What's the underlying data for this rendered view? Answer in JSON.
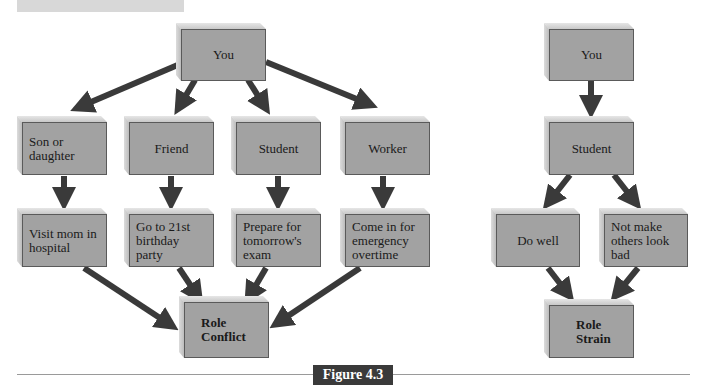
{
  "figure": {
    "label": "Figure 4.3"
  },
  "role_conflict": {
    "root": "You",
    "roles": [
      "Son or\ndaughter",
      "Friend",
      "Student",
      "Worker"
    ],
    "demands": [
      "Visit mom in\nhospital",
      "Go to 21st\nbirthday\nparty",
      "Prepare for\ntomorrow's\nexam",
      "Come in for\nemergency\novertime"
    ],
    "result": "Role\nConflict"
  },
  "role_strain": {
    "root": "You",
    "role": "Student",
    "demands": [
      "Do well",
      "Not make\nothers look\nbad"
    ],
    "result": "Role\nStrain"
  },
  "colors": {
    "box_face": "#a2a2a2",
    "box_bevel": "#d0d0d0",
    "arrow": "#3a3a3a",
    "figure_label_bg": "#3a3a3a",
    "figure_label_text": "#ffffff"
  }
}
